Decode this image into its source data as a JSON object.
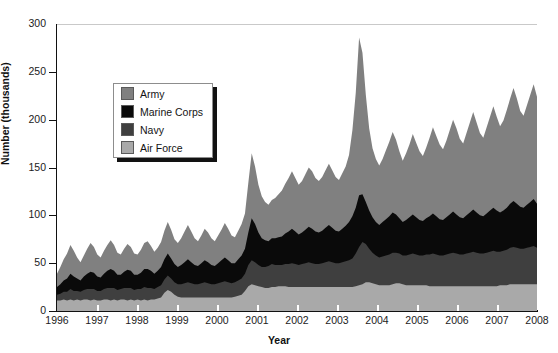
{
  "chart_data": {
    "type": "area",
    "stacked": true,
    "title": "",
    "xlabel": "Year",
    "ylabel": "Number (thousands)",
    "xlim": [
      1996,
      2008
    ],
    "ylim": [
      0,
      300
    ],
    "yticks": [
      0,
      50,
      100,
      150,
      200,
      250,
      300
    ],
    "xticks": [
      "1996",
      "1997",
      "1998",
      "1999",
      "2000",
      "2001",
      "2002",
      "2003",
      "2004",
      "2005",
      "2006",
      "2007",
      "2008"
    ],
    "grid": "top-only",
    "legend_position": "upper-left-inset",
    "stack_order_bottom_to_top": [
      "Air Force",
      "Navy",
      "Marine Corps",
      "Army"
    ],
    "colors": {
      "Army": "#808080",
      "Marine Corps": "#0a0a0a",
      "Navy": "#3f3f3f",
      "Air Force": "#a9a9a9"
    },
    "annotations": [
      "Peak total of approximately 293 thousand in early 2003",
      "Baseline total of roughly 40-60 thousand from 1996 through 2001",
      "Sustained elevated totals of roughly 140-205 thousand from 2004 through 2008"
    ],
    "series": [
      {
        "name": "Air Force",
        "color": "#a9a9a9",
        "values": [
          11,
          11,
          12,
          11,
          12,
          11,
          12,
          11,
          12,
          12,
          11,
          12,
          11,
          11,
          12,
          12,
          11,
          12,
          11,
          12,
          12,
          11,
          12,
          11,
          12,
          11,
          12,
          11,
          12,
          12,
          13,
          14,
          19,
          22,
          20,
          17,
          15,
          14,
          14,
          14,
          14,
          14,
          14,
          14,
          14,
          14,
          14,
          14,
          14,
          14,
          14,
          14,
          14,
          15,
          16,
          17,
          21,
          26,
          28,
          27,
          26,
          25,
          24,
          24,
          25,
          25,
          26,
          26,
          26,
          25,
          25,
          25,
          25,
          25,
          25,
          25,
          25,
          25,
          25,
          25,
          25,
          25,
          25,
          25,
          25,
          25,
          25,
          25,
          25,
          26,
          27,
          28,
          30,
          30,
          29,
          28,
          27,
          27,
          27,
          27,
          28,
          29,
          29,
          28,
          27,
          27,
          27,
          27,
          27,
          27,
          27,
          26,
          26,
          26,
          26,
          26,
          26,
          26,
          26,
          26,
          26,
          26,
          26,
          26,
          26,
          26,
          26,
          26,
          26,
          26,
          26,
          26,
          27,
          27,
          27,
          28,
          28,
          28,
          28,
          28,
          28,
          28,
          28,
          28
        ]
      },
      {
        "name": "Navy",
        "color": "#3f3f3f",
        "values": [
          6,
          7,
          8,
          9,
          11,
          10,
          9,
          9,
          10,
          11,
          12,
          11,
          10,
          10,
          11,
          12,
          13,
          12,
          11,
          11,
          12,
          13,
          12,
          11,
          11,
          12,
          13,
          13,
          12,
          11,
          12,
          13,
          14,
          15,
          14,
          13,
          13,
          14,
          15,
          16,
          15,
          14,
          14,
          15,
          16,
          15,
          14,
          14,
          15,
          16,
          17,
          16,
          15,
          15,
          16,
          17,
          18,
          22,
          25,
          24,
          22,
          21,
          22,
          23,
          24,
          23,
          22,
          22,
          23,
          24,
          25,
          24,
          23,
          24,
          25,
          26,
          25,
          24,
          24,
          25,
          26,
          27,
          26,
          25,
          25,
          26,
          27,
          28,
          30,
          34,
          40,
          44,
          40,
          35,
          32,
          30,
          29,
          30,
          31,
          32,
          33,
          32,
          31,
          30,
          31,
          32,
          33,
          32,
          31,
          31,
          32,
          33,
          34,
          33,
          32,
          32,
          33,
          34,
          35,
          34,
          33,
          33,
          34,
          35,
          36,
          35,
          34,
          34,
          35,
          36,
          37,
          36,
          35,
          36,
          37,
          38,
          39,
          38,
          37,
          37,
          38,
          39,
          40,
          38
        ]
      },
      {
        "name": "Marine Corps",
        "color": "#0a0a0a",
        "values": [
          8,
          10,
          12,
          14,
          16,
          15,
          13,
          12,
          14,
          16,
          18,
          17,
          15,
          14,
          16,
          18,
          20,
          18,
          16,
          15,
          17,
          19,
          18,
          16,
          15,
          17,
          19,
          20,
          18,
          16,
          17,
          19,
          21,
          23,
          21,
          19,
          18,
          20,
          22,
          24,
          22,
          20,
          19,
          21,
          23,
          22,
          20,
          19,
          21,
          23,
          25,
          23,
          21,
          20,
          22,
          24,
          26,
          34,
          44,
          40,
          34,
          30,
          28,
          26,
          27,
          28,
          29,
          30,
          32,
          34,
          36,
          34,
          32,
          33,
          35,
          37,
          36,
          34,
          33,
          34,
          36,
          38,
          36,
          34,
          33,
          35,
          37,
          40,
          44,
          48,
          54,
          50,
          44,
          40,
          37,
          35,
          34,
          36,
          38,
          40,
          42,
          40,
          37,
          35,
          37,
          39,
          41,
          39,
          37,
          36,
          38,
          40,
          42,
          40,
          38,
          37,
          39,
          41,
          43,
          41,
          39,
          38,
          40,
          42,
          44,
          42,
          40,
          39,
          41,
          43,
          45,
          43,
          41,
          42,
          44,
          46,
          48,
          46,
          44,
          43,
          45,
          47,
          49,
          46
        ]
      },
      {
        "name": "Army",
        "color": "#808080",
        "values": [
          14,
          18,
          22,
          26,
          30,
          27,
          22,
          19,
          22,
          26,
          30,
          27,
          23,
          21,
          24,
          27,
          30,
          27,
          23,
          21,
          24,
          27,
          25,
          22,
          21,
          24,
          27,
          29,
          26,
          23,
          24,
          26,
          30,
          33,
          30,
          26,
          25,
          28,
          32,
          36,
          32,
          28,
          26,
          29,
          33,
          31,
          28,
          26,
          29,
          32,
          36,
          33,
          29,
          27,
          30,
          33,
          37,
          52,
          68,
          60,
          50,
          44,
          40,
          38,
          40,
          42,
          45,
          48,
          52,
          56,
          60,
          56,
          52,
          54,
          58,
          62,
          60,
          56,
          54,
          56,
          60,
          64,
          60,
          56,
          54,
          58,
          62,
          70,
          90,
          120,
          165,
          148,
          112,
          86,
          72,
          66,
          62,
          66,
          72,
          78,
          84,
          78,
          70,
          64,
          70,
          76,
          84,
          78,
          72,
          68,
          74,
          82,
          90,
          84,
          78,
          74,
          80,
          88,
          96,
          90,
          82,
          78,
          86,
          94,
          102,
          94,
          86,
          82,
          90,
          98,
          106,
          98,
          90,
          94,
          102,
          110,
          118,
          110,
          100,
          96,
          104,
          112,
          120,
          112
        ]
      }
    ],
    "x_values_note": "144 monthly observations from Jan 1996 through Dec 2007, spanning the 1996-2008 axis"
  },
  "legend": {
    "items": [
      {
        "label": "Army",
        "swatch": "#808080"
      },
      {
        "label": "Marine Corps",
        "swatch": "#0a0a0a"
      },
      {
        "label": "Navy",
        "swatch": "#3f3f3f"
      },
      {
        "label": "Air Force",
        "swatch": "#a9a9a9"
      }
    ]
  },
  "axes": {
    "ylabel": "Number (thousands)",
    "xlabel": "Year",
    "yticks": [
      "300",
      "250",
      "200",
      "150",
      "100",
      "50",
      "0"
    ],
    "xticks": [
      "1996",
      "1997",
      "1998",
      "1999",
      "2000",
      "2001",
      "2002",
      "2003",
      "2004",
      "2005",
      "2006",
      "2007",
      "2008"
    ]
  }
}
